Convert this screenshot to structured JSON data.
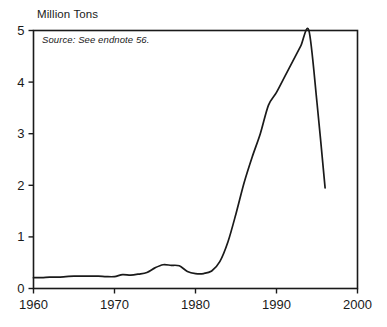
{
  "chart_data": {
    "type": "line",
    "title": "Million Tons",
    "xlabel": "",
    "ylabel": "Million Tons",
    "annotation": "Source: See endnote 56.",
    "xlim": [
      1960,
      2000
    ],
    "ylim": [
      0,
      5
    ],
    "grid": false,
    "legend": "none",
    "xticks": [
      "1960",
      "1970",
      "1980",
      "1990",
      "2000"
    ],
    "xtick_values": [
      1960,
      1970,
      1980,
      1990,
      2000
    ],
    "yticks": [
      "0",
      "1",
      "2",
      "3",
      "4",
      "5"
    ],
    "ytick_values": [
      0,
      1,
      2,
      3,
      4,
      5
    ],
    "line_color": "#1a1a1a",
    "frame_color": "#1a1a1a",
    "background": "#ffffff",
    "series": [
      {
        "name": "Million Tons",
        "x": [
          1960,
          1961,
          1962,
          1963,
          1964,
          1965,
          1966,
          1967,
          1968,
          1969,
          1970,
          1971,
          1972,
          1973,
          1974,
          1975,
          1976,
          1977,
          1978,
          1979,
          1980,
          1981,
          1982,
          1983,
          1984,
          1985,
          1986,
          1987,
          1988,
          1989,
          1990,
          1991,
          1992,
          1993,
          1994,
          1995,
          1996
        ],
        "values": [
          0.21,
          0.21,
          0.22,
          0.22,
          0.23,
          0.24,
          0.24,
          0.24,
          0.24,
          0.23,
          0.23,
          0.27,
          0.26,
          0.28,
          0.31,
          0.4,
          0.46,
          0.45,
          0.44,
          0.33,
          0.29,
          0.29,
          0.34,
          0.52,
          0.9,
          1.45,
          2.05,
          2.55,
          3.0,
          3.55,
          3.8,
          4.1,
          4.4,
          4.7,
          5.0,
          3.6,
          1.95
        ]
      }
    ]
  },
  "axes": {
    "y_title": "Million Tons"
  }
}
